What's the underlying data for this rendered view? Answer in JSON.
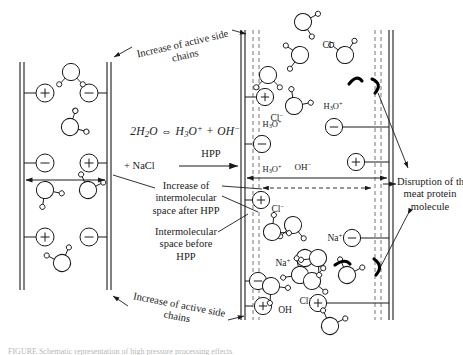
{
  "figure": {
    "domain_note": "schematic diagram"
  },
  "labels": {
    "equation": "2H2O ⇔ H3O+ + OH−",
    "nacl": "+ NaCl",
    "hpp_arrow": "HPP",
    "increase_side_chains_top": "Increase of active side\nchains",
    "increase_side_chains_bottom": "Increase of active side\nchains",
    "increase_intermolecular": "Increase of\nintermolecular\nspace after HPP",
    "space_before": "Intermolecular\nspace before\nHPP",
    "disruption": "Disruption of the\nmeat protein\nmolecule"
  },
  "equation_parts": {
    "coef": "2",
    "water": "H",
    "water_sub": "2",
    "water_o": "O",
    "equiv": "⇔",
    "hydronium": "H",
    "hydronium_sub": "3",
    "hydronium_o": "O",
    "hydronium_sup": "+",
    "plus": "+",
    "hydroxide": "OH",
    "hydroxide_sup": "−"
  },
  "left_panel": {
    "name": "untreated-meat-protein",
    "charges": [
      {
        "sign": "+",
        "x": 45,
        "y": 93
      },
      {
        "sign": "−",
        "x": 89,
        "y": 93
      },
      {
        "sign": "−",
        "x": 45,
        "y": 163
      },
      {
        "sign": "+",
        "x": 89,
        "y": 163
      },
      {
        "sign": "+",
        "x": 45,
        "y": 237
      },
      {
        "sign": "−",
        "x": 89,
        "y": 237
      }
    ],
    "water_molecules": [
      {
        "x": 71,
        "y": 72
      },
      {
        "x": 70,
        "y": 124
      },
      {
        "x": 47,
        "y": 188
      },
      {
        "x": 88,
        "y": 188
      },
      {
        "x": 62,
        "y": 264
      }
    ]
  },
  "right_panel": {
    "name": "hpp-treated-meat-protein",
    "charges": [
      {
        "sign": "+",
        "x": 265,
        "y": 97
      },
      {
        "sign": "−",
        "x": 265,
        "y": 144
      },
      {
        "sign": "−",
        "x": 334,
        "y": 127
      },
      {
        "sign": "+",
        "x": 356,
        "y": 162
      },
      {
        "sign": "+",
        "x": 261,
        "y": 200
      },
      {
        "sign": "−",
        "x": 352,
        "y": 238
      },
      {
        "sign": "−",
        "x": 258,
        "y": 281
      },
      {
        "sign": "+",
        "x": 262,
        "y": 306
      },
      {
        "sign": "+",
        "x": 318,
        "y": 303
      }
    ],
    "ions": [
      {
        "formula": "Cl",
        "charge": "−",
        "x": 275,
        "y": 121
      },
      {
        "formula": "Cl",
        "charge": "−",
        "x": 327,
        "y": 48
      },
      {
        "formula": "H3O",
        "charge": "+",
        "x": 270,
        "y": 171
      },
      {
        "formula": "H3O",
        "charge": "+",
        "x": 269,
        "y": 125
      },
      {
        "formula": "H3O",
        "charge": "+",
        "x": 330,
        "y": 107
      },
      {
        "formula": "OH",
        "charge": "−",
        "x": 302,
        "y": 168
      },
      {
        "formula": "Cl",
        "charge": "−",
        "x": 275,
        "y": 211
      },
      {
        "formula": "Na",
        "charge": "+",
        "x": 333,
        "y": 240
      },
      {
        "formula": "Na",
        "charge": "+",
        "x": 281,
        "y": 265
      },
      {
        "formula": "OH",
        "charge": "",
        "x": 284,
        "y": 312
      },
      {
        "formula": "Cl",
        "charge": "−",
        "x": 303,
        "y": 303
      }
    ]
  },
  "measurement": {
    "before_label_ref": "Intermolecular space before HPP",
    "after_label_ref": "Increase of intermolecular space after HPP"
  },
  "colors": {
    "stroke": "#1a1a1a",
    "fill": "#ffffff",
    "dashed": "#555555",
    "caption": "#b8b8b8"
  },
  "caption": "FIGURE  Schematic representation of high pressure processing effects"
}
